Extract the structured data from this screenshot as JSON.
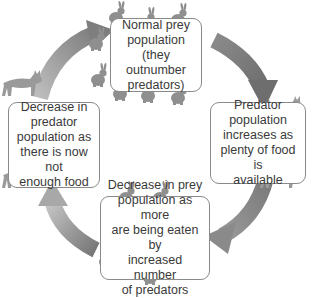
{
  "diagram": {
    "type": "cycle",
    "direction": "clockwise",
    "colors": {
      "arrow": "#8c8c8c",
      "box_border": "#8a8a8a",
      "text": "#3a3a3a",
      "rabbit": "#8f8f8f",
      "lynx": "#9a9a9a"
    },
    "stages": [
      {
        "position": "top",
        "lines": [
          "Normal prey",
          "population",
          "(they outnumber",
          "predators)"
        ]
      },
      {
        "position": "right",
        "lines": [
          "Predator",
          "population",
          "increases as",
          "plenty of food is",
          "available"
        ]
      },
      {
        "position": "bottom",
        "lines": [
          "Decrease in prey",
          "population as more",
          "are being eaten by",
          "increased number",
          "of predators"
        ]
      },
      {
        "position": "left",
        "lines": [
          "Decrease in",
          "predator",
          "population as",
          "there is now not",
          "enough food"
        ]
      }
    ],
    "icons": {
      "prey": "rabbit-icon",
      "predator": "lynx-icon",
      "cycle_arrow": "curved-arrow-icon"
    }
  }
}
